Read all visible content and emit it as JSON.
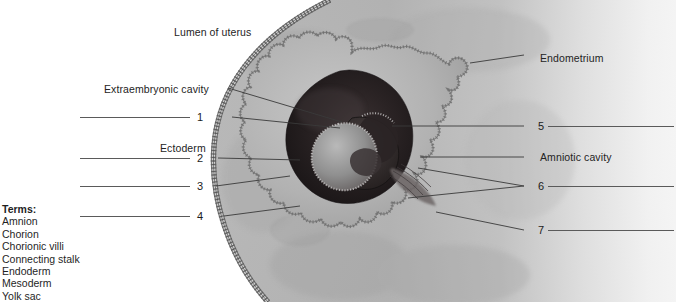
{
  "figure": {
    "title_text": "Lumen of uterus",
    "type": "anatomical-illustration"
  },
  "labels": {
    "lumen_of_uterus": "Lumen of uterus",
    "extraembryonic_cavity": "Extraembryonic cavity",
    "ectoderm": "Ectoderm",
    "endometrium": "Endometrium",
    "amniotic_cavity": "Amniotic cavity"
  },
  "callouts": [
    {
      "id": "1",
      "number": "1",
      "side": "left",
      "y": 117
    },
    {
      "id": "2",
      "number": "2",
      "side": "left",
      "y": 158
    },
    {
      "id": "3",
      "number": "3",
      "side": "left",
      "y": 186
    },
    {
      "id": "4",
      "number": "4",
      "side": "left",
      "y": 216
    },
    {
      "id": "5",
      "number": "5",
      "side": "right",
      "y": 126
    },
    {
      "id": "6",
      "number": "6",
      "side": "right",
      "y": 186
    },
    {
      "id": "7",
      "number": "7",
      "side": "right",
      "y": 230
    }
  ],
  "terms": {
    "heading": "Terms:",
    "items": [
      "Amnion",
      "Chorion",
      "Chorionic villi",
      "Connecting stalk",
      "Endoderm",
      "Mesoderm",
      "Yolk sac"
    ]
  },
  "colors": {
    "ink": "#242424",
    "leader_line": "#5a5a5a",
    "endometrium_light": "#cfcfcf",
    "endometrium_mid": "#ababab",
    "endometrium_dark": "#8d8d8d",
    "chorion_fill": "#b4b4b4",
    "cavity_dark": "#241f1f",
    "cavity_darker": "#1a1616",
    "embryo_light": "#9a9a9a",
    "page_bg": "#ffffff"
  }
}
